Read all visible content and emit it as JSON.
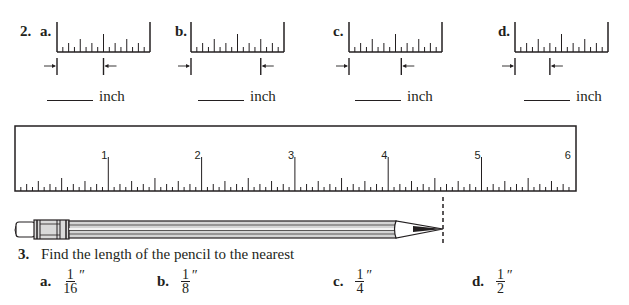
{
  "question2": {
    "number": "2.",
    "rulers": [
      {
        "label": "a.",
        "answer_blank": "",
        "unit": "inch",
        "measure_sixteenths": 8
      },
      {
        "label": "b.",
        "answer_blank": "",
        "unit": "inch",
        "measure_sixteenths": 12
      },
      {
        "label": "c.",
        "answer_blank": "",
        "unit": "inch",
        "measure_sixteenths": 9
      },
      {
        "label": "d.",
        "answer_blank": "",
        "unit": "inch",
        "measure_sixteenths": 6
      }
    ]
  },
  "big_ruler": {
    "inch_labels": [
      "1",
      "2",
      "3",
      "4",
      "5",
      "6"
    ],
    "divisions_per_inch": 8
  },
  "pencil": {
    "tip_mark": "dashed-line"
  },
  "question3": {
    "number": "3.",
    "prompt": "Find the length of the pencil to the nearest",
    "choices": [
      {
        "label": "a.",
        "numerator": "1",
        "denominator": "16",
        "unit_mark": "″"
      },
      {
        "label": "b.",
        "numerator": "1",
        "denominator": "8",
        "unit_mark": "″"
      },
      {
        "label": "c.",
        "numerator": "1",
        "denominator": "4",
        "unit_mark": "″"
      },
      {
        "label": "d.",
        "numerator": "1",
        "denominator": "2",
        "unit_mark": "″"
      }
    ]
  }
}
